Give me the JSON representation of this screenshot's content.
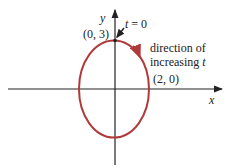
{
  "diagram": {
    "axes": {
      "x_label": "x",
      "y_label": "y"
    },
    "curve": {
      "shape": "ellipse",
      "semi_axis_x": 2,
      "semi_axis_y": 3,
      "color": "#b03a3a"
    },
    "annotations": {
      "start_point": "(0, 3)",
      "t_zero_var": "t",
      "t_zero_eq": " = 0",
      "x_intercept": "(2, 0)",
      "direction_line1": "direction of",
      "direction_line2": "increasing ",
      "direction_var": "t"
    },
    "colors": {
      "axis": "#222222",
      "curve": "#b03a3a",
      "text": "#222222"
    }
  }
}
